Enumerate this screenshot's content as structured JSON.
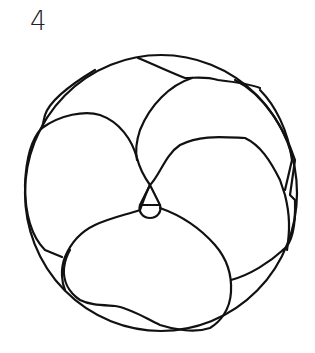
{
  "figure": {
    "label": "4",
    "stroke_color": "#111111",
    "background": "#ffffff"
  }
}
